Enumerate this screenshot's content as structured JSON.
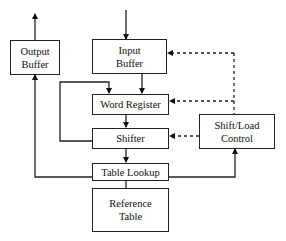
{
  "diagram": {
    "type": "block-diagram",
    "nodes": {
      "output_buffer": {
        "line1": "Output",
        "line2": "Buffer"
      },
      "input_buffer": {
        "line1": "Input",
        "line2": "Buffer"
      },
      "word_register": {
        "label": "Word Register"
      },
      "shifter": {
        "label": "Shifter"
      },
      "table_lookup": {
        "label": "Table Lookup"
      },
      "reference_table": {
        "line1": "Reference",
        "line2": "Table"
      },
      "shift_load_control": {
        "line1": "Shift/Load",
        "line2": "Control"
      }
    },
    "edges": [
      {
        "from": "external",
        "to": "input_buffer",
        "style": "solid"
      },
      {
        "from": "input_buffer",
        "to": "word_register",
        "style": "solid"
      },
      {
        "from": "shifter",
        "to": "word_register",
        "style": "solid",
        "note": "feedback loop on left side"
      },
      {
        "from": "word_register",
        "to": "shifter",
        "style": "solid"
      },
      {
        "from": "shifter",
        "to": "table_lookup",
        "style": "solid"
      },
      {
        "from": "table_lookup",
        "to": "reference_table",
        "style": "solid"
      },
      {
        "from": "table_lookup",
        "to": "output_buffer",
        "style": "solid"
      },
      {
        "from": "output_buffer",
        "to": "external",
        "style": "solid"
      },
      {
        "from": "table_lookup",
        "to": "shift_load_control",
        "style": "solid"
      },
      {
        "from": "shift_load_control",
        "to": "input_buffer",
        "style": "dotted"
      },
      {
        "from": "shift_load_control",
        "to": "word_register",
        "style": "dotted"
      },
      {
        "from": "shift_load_control",
        "to": "shifter",
        "style": "dotted"
      }
    ]
  }
}
